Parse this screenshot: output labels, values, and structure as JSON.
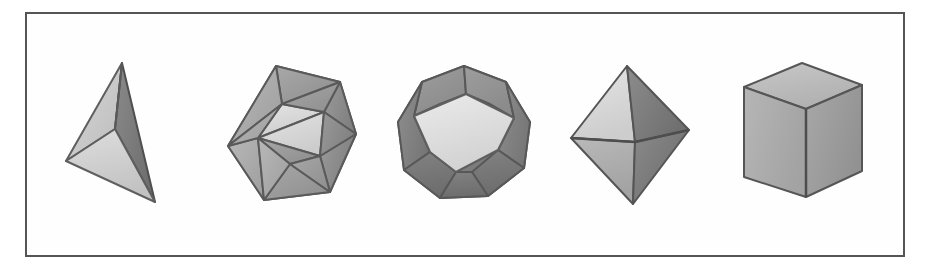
{
  "figure": {
    "background_color": "#ffffff",
    "frame": {
      "border_color": "#555555",
      "border_width_px": 2,
      "fill_color": "#fefefe",
      "x": 25,
      "y": 12,
      "width": 880,
      "height": 245
    },
    "render_style": "grayscale shaded halftone line-drawing",
    "palette": {
      "face_light": "#e2e2e2",
      "face_mid": "#b4b4b4",
      "face_dark": "#8e8e8e",
      "face_darker": "#787878",
      "edge": "#5a5a5a",
      "edge_soft": "#6e6e6e"
    },
    "solids": [
      {
        "index": 1,
        "name": "tetrahedron",
        "label": "Tetrahedron",
        "faces": 4,
        "face_shape": "triangle",
        "vertices": 4,
        "edges": 6,
        "orientation": "apex up, tilted"
      },
      {
        "index": 2,
        "name": "icosahedron",
        "label": "Icosahedron",
        "faces": 20,
        "face_shape": "triangle",
        "vertices": 12,
        "edges": 30,
        "orientation": "face forward"
      },
      {
        "index": 3,
        "name": "dodecahedron",
        "label": "Dodecahedron",
        "faces": 12,
        "face_shape": "pentagon",
        "vertices": 20,
        "edges": 30,
        "orientation": "pentagon face forward"
      },
      {
        "index": 4,
        "name": "octahedron",
        "label": "Octahedron",
        "faces": 8,
        "face_shape": "triangle",
        "vertices": 6,
        "edges": 12,
        "orientation": "vertex up"
      },
      {
        "index": 5,
        "name": "hexahedron-cube",
        "label": "Cube",
        "faces": 6,
        "face_shape": "square",
        "vertices": 8,
        "edges": 12,
        "orientation": "three-quarter view"
      }
    ]
  }
}
